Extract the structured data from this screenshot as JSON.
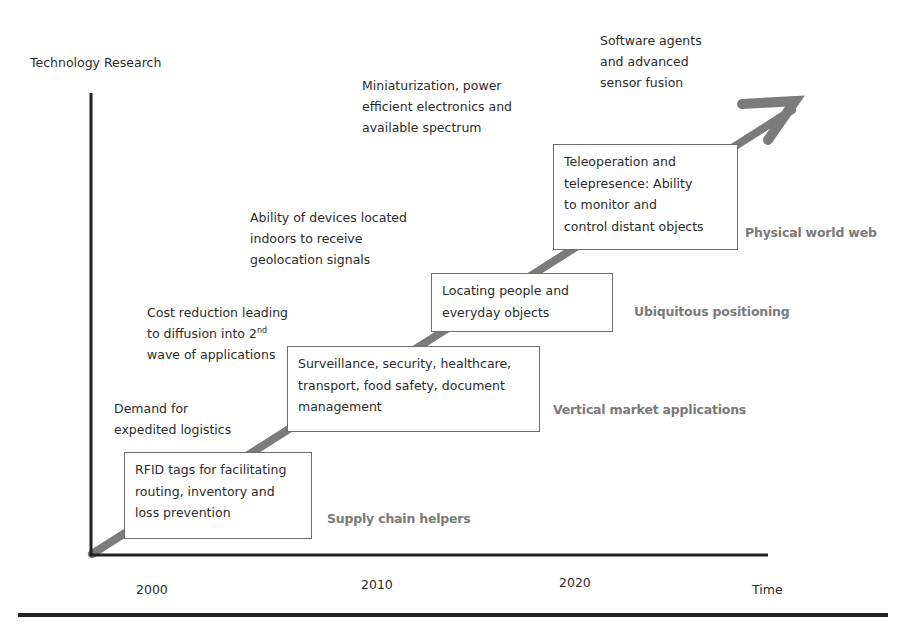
{
  "diagram": {
    "y_axis_label": "Technology Research",
    "x_axis_label": "Time",
    "x_ticks": [
      "2000",
      "2010",
      "2020"
    ],
    "drivers": [
      {
        "id": "demand",
        "lines": [
          "Demand for",
          "expedited logistics"
        ]
      },
      {
        "id": "cost",
        "lines": [
          "Cost reduction leading",
          "to diffusion into 2",
          "wave of applications"
        ],
        "superscript": "nd"
      },
      {
        "id": "indoor",
        "lines": [
          "Ability of devices located",
          "indoors to receive",
          "geolocation signals"
        ]
      },
      {
        "id": "miniaturization",
        "lines": [
          "Miniaturization,  power",
          "efficient electronics and",
          "available spectrum"
        ]
      },
      {
        "id": "software",
        "lines": [
          "Software  agents",
          "and advanced",
          "sensor fusion"
        ]
      }
    ],
    "boxes": [
      {
        "id": "rfid",
        "lines": [
          "RFID tags for facilitating",
          "routing, inventory and",
          "loss prevention"
        ]
      },
      {
        "id": "surveillance",
        "lines": [
          "Surveillance, security, healthcare,",
          "transport, food safety, document",
          "management"
        ]
      },
      {
        "id": "locating",
        "lines": [
          "Locating people and",
          "everyday objects"
        ]
      },
      {
        "id": "teleoperation",
        "lines": [
          "Teleoperation and",
          "telepresence: Ability",
          "to monitor and",
          "control distant objects"
        ]
      }
    ],
    "stages": [
      {
        "id": "supply",
        "label": "Supply chain helpers"
      },
      {
        "id": "vertical",
        "label": "Vertical market applications"
      },
      {
        "id": "ubiquitous",
        "label": "Ubiquitous positioning"
      },
      {
        "id": "physical",
        "label": "Physical world web"
      }
    ],
    "colors": {
      "axis": "#222222",
      "arrow": "#7b7b7b",
      "stage_text": "#7a7a7a",
      "box_border": "#6d6d6d"
    }
  }
}
